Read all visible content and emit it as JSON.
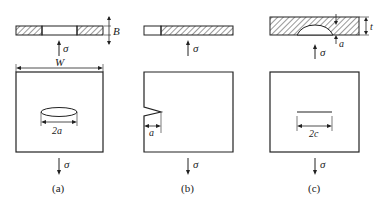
{
  "figure": {
    "panels": [
      {
        "id": "a",
        "caption": "(a)",
        "stress_label": "σ",
        "crack_type": "through-thickness center crack (elliptical)",
        "dimension_label": "2a",
        "width_label": "W",
        "thickness_label": "B"
      },
      {
        "id": "b",
        "caption": "(b)",
        "stress_label": "σ",
        "crack_type": "edge notch crack",
        "dimension_label": "a"
      },
      {
        "id": "c",
        "caption": "(c)",
        "stress_label": "σ",
        "crack_type": "semi-elliptical surface crack",
        "dimension_label": "2c",
        "depth_label": "a",
        "thickness_label": "t"
      }
    ],
    "colors": {
      "line": "#222222",
      "background": "#ffffff"
    }
  }
}
